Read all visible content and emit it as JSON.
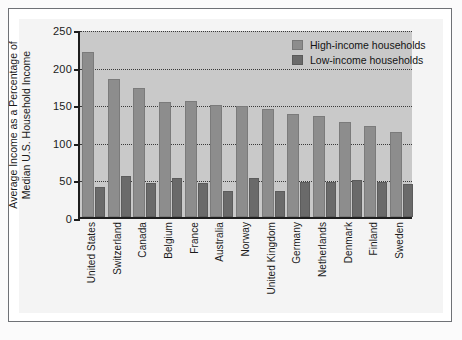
{
  "chart_data": {
    "type": "bar",
    "title": "",
    "subtitle": "",
    "xlabel": "",
    "ylabel_line1": "Average Income as a Percentage of",
    "ylabel_line2": "Median U.S. Household Income",
    "ylim": [
      0,
      250
    ],
    "yticks": [
      0,
      50,
      100,
      150,
      200,
      250
    ],
    "ytick_labels": [
      "0",
      "50",
      "100",
      "150",
      "200",
      "250"
    ],
    "grid": true,
    "grid_style": "dotted",
    "legend_position": "top-right",
    "categories": [
      "United States",
      "Switzerland",
      "Canada",
      "Belgium",
      "France",
      "Australia",
      "Norway",
      "United Kingdom",
      "Germany",
      "Netherlands",
      "Denmark",
      "Finland",
      "Sweden"
    ],
    "series": [
      {
        "name": "High-income households",
        "color": "#8d8d8d",
        "values": [
          220,
          183,
          172,
          153,
          154,
          149,
          148,
          143,
          137,
          134,
          127,
          121,
          113
        ]
      },
      {
        "name": "Low-income households",
        "color": "#6a6a6a",
        "values": [
          40,
          54,
          45,
          52,
          45,
          35,
          52,
          34,
          47,
          47,
          49,
          46,
          44
        ]
      }
    ]
  },
  "colors": {
    "plot_background": "#c9c9c9",
    "panel_background": "#f4f4f4",
    "page_background": "#fbfbfb",
    "axis": "#1d1d1d",
    "gridline": "#3a3a3a",
    "frame": "#6f7276",
    "high_income_bar": "#8d8d8d",
    "low_income_bar": "#6a6a6a"
  }
}
